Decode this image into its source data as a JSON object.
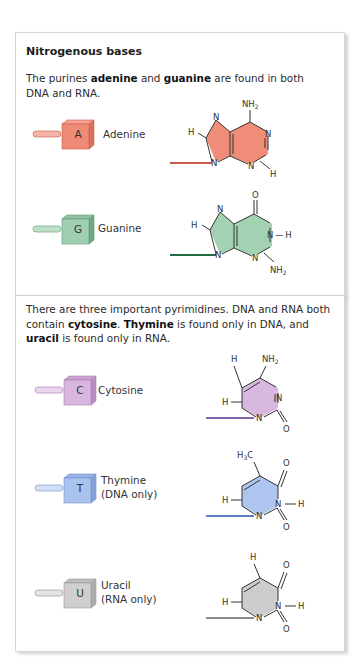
{
  "purines": {
    "heading": "Nitrogenous bases",
    "intro": {
      "t1": "The purines ",
      "b1": "adenine",
      "t2": " and ",
      "b2": "guanine",
      "t3": " are found in both DNA and RNA."
    },
    "bases": [
      {
        "letter": "A",
        "name": "Adenine",
        "color": "#ee8a76",
        "color_dark": "#c95f4d",
        "link_color": "#c75a4a",
        "atoms": {
          "amine": "NH",
          "amine_sub": "2",
          "n": "N",
          "h": "H"
        }
      },
      {
        "letter": "G",
        "name": "Guanine",
        "color": "#9fcfb0",
        "color_dark": "#5e9a74",
        "link_color": "#1f6a3d",
        "atoms": {
          "amine": "NH",
          "amine_sub": "2",
          "n": "N",
          "h": "H",
          "o": "O",
          "nh": "N — H"
        }
      }
    ]
  },
  "pyrimidines": {
    "intro": {
      "t1": "There are three important pyrimidines. DNA and RNA both contain ",
      "b1": "cytosine",
      "t2": ". ",
      "b2": "Thymine",
      "t3": " is found only in DNA, and ",
      "b3": "uracil",
      "t4": " is found only in RNA."
    },
    "bases": [
      {
        "letter": "C",
        "name": "Cytosine",
        "note": "",
        "color": "#d8b6df",
        "color_dark": "#a87fb2",
        "link_color": "#8a62a8",
        "atoms": {
          "amine": "NH",
          "amine_sub": "2",
          "n": "N",
          "h": "H",
          "o": "O"
        }
      },
      {
        "letter": "T",
        "name": "Thymine",
        "note": "(DNA only)",
        "color": "#aac3ee",
        "color_dark": "#6f8fcc",
        "link_color": "#5b82c0",
        "atoms": {
          "methyl": "H",
          "methyl_sub": "3",
          "methyl_c": "C",
          "n": "N",
          "h": "H",
          "o": "O"
        }
      },
      {
        "letter": "U",
        "name": "Uracil",
        "note": "(RNA only)",
        "color": "#cfcfcf",
        "color_dark": "#999999",
        "link_color": "#8a8a8a",
        "atoms": {
          "n": "N",
          "h": "H",
          "o": "O"
        }
      }
    ]
  }
}
